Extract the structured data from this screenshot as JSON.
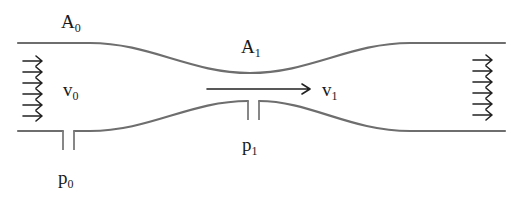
{
  "diagram": {
    "type": "venturi-tube",
    "labels": {
      "area_inlet": {
        "base": "A",
        "sub": "0"
      },
      "area_throat": {
        "base": "A",
        "sub": "1"
      },
      "velocity_inlet": {
        "base": "v",
        "sub": "0"
      },
      "velocity_throat": {
        "base": "v",
        "sub": "1"
      },
      "pressure_inlet": {
        "base": "p",
        "sub": "0"
      },
      "pressure_throat": {
        "base": "p",
        "sub": "1"
      }
    },
    "colors": {
      "wall": "#6e6e6e",
      "arrow": "#222222",
      "text": "#1a1a1a",
      "background": "#ffffff"
    },
    "inlet_flow_arrows": 6,
    "outlet_flow_arrows": 6
  }
}
